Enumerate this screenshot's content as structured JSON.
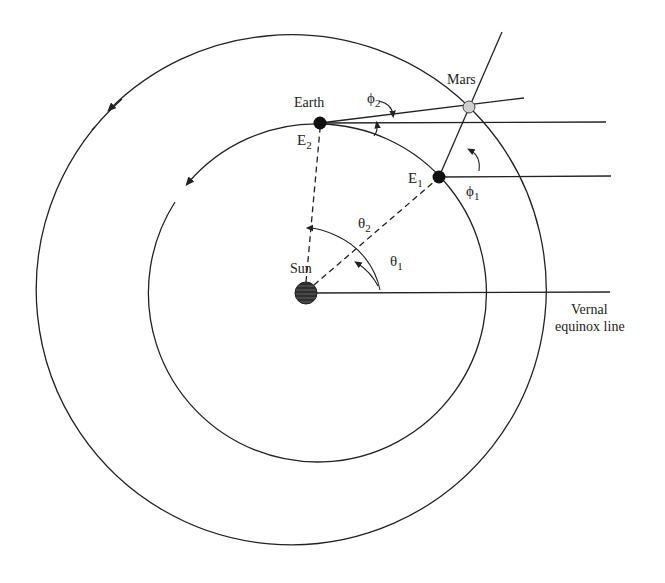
{
  "diagram": {
    "labels": {
      "earth": "Earth",
      "mars": "Mars",
      "sun": "Sun",
      "e1": "E",
      "e1_sub": "1",
      "e2": "E",
      "e2_sub": "2",
      "theta1": "θ",
      "theta1_sub": "1",
      "theta2": "θ",
      "theta2_sub": "2",
      "phi1": "ϕ",
      "phi1_sub": "1",
      "phi2": "ϕ",
      "phi2_sub": "2",
      "vernal_line1": "Vernal",
      "vernal_line2": "equinox line"
    },
    "bodies": [
      {
        "name": "Sun",
        "x": 306,
        "y": 293,
        "r": 11
      },
      {
        "name": "Earth (E2)",
        "x": 320,
        "y": 123,
        "r": 6
      },
      {
        "name": "E1",
        "x": 439,
        "y": 177,
        "r": 6
      },
      {
        "name": "Mars",
        "x": 469,
        "y": 107,
        "r": 6
      }
    ],
    "orbits": [
      {
        "name": "Mars orbit",
        "cx": 290,
        "cy": 290,
        "r": 255
      },
      {
        "name": "Earth orbit",
        "cx": 316,
        "cy": 293,
        "r": 169
      }
    ],
    "colors": {
      "line": "#222222",
      "sun": "#3a3a3a",
      "earth": "#111111",
      "mars": "#cfcfcf"
    }
  }
}
